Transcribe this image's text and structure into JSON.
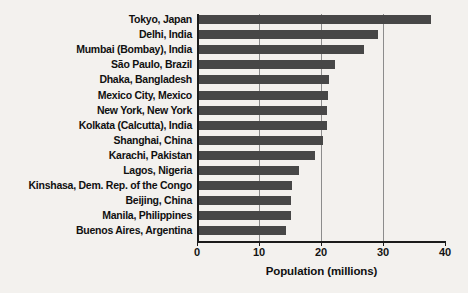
{
  "chart_data": {
    "type": "bar",
    "orientation": "horizontal",
    "title": "",
    "xlabel": "Population (millions)",
    "ylabel": "",
    "xlim": [
      0,
      40
    ],
    "xticks": [
      0,
      10,
      20,
      30,
      40
    ],
    "xtick_labels": [
      "0",
      "10",
      "20",
      "30",
      "40"
    ],
    "grid": "vertical gridlines at 10, 20, 30",
    "legend": "none",
    "bar_color": "#474747",
    "categories": [
      "Tokyo, Japan",
      "Delhi, India",
      "Mumbai (Bombay), India",
      "São Paulo, Brazil",
      "Dhaka, Bangladesh",
      "Mexico City, Mexico",
      "New York, New York",
      "Kolkata (Calcutta), India",
      "Shanghai, China",
      "Karachi, Pakistan",
      "Lagos, Nigeria",
      "Kinshasa, Dem. Rep. of the Congo",
      "Beijing, China",
      "Manila, Philippines",
      "Buenos Aires, Argentina"
    ],
    "values": [
      37.8,
      29.2,
      26.9,
      22.2,
      21.3,
      21.2,
      21.0,
      21.0,
      20.4,
      19.0,
      16.4,
      15.4,
      15.2,
      15.1,
      14.4
    ]
  },
  "axis": {
    "x_title": "Population (millions)",
    "ticks": [
      "0",
      "10",
      "20",
      "30",
      "40"
    ]
  }
}
